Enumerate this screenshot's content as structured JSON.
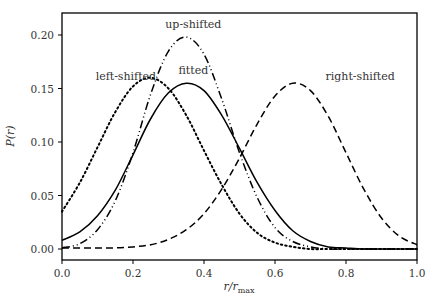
{
  "chart_data": {
    "type": "line",
    "title": "",
    "xlabel": "r/r_max",
    "ylabel": "P(r)",
    "xlim": [
      0.0,
      1.0
    ],
    "ylim": [
      -0.01,
      0.22
    ],
    "grid": false,
    "legend": "none (curves labeled with inline annotations)",
    "x_ticks": [
      "0.0",
      "0.2",
      "0.4",
      "0.6",
      "0.8",
      "1.0"
    ],
    "y_ticks": [
      "0.00",
      "0.05",
      "0.10",
      "0.15",
      "0.20"
    ],
    "x": [
      0.0,
      0.05,
      0.1,
      0.15,
      0.2,
      0.25,
      0.3,
      0.35,
      0.4,
      0.45,
      0.5,
      0.55,
      0.6,
      0.65,
      0.7,
      0.75,
      0.8,
      0.85,
      0.9,
      0.95,
      1.0
    ],
    "series": [
      {
        "name": "fitted",
        "style": "solid",
        "values": [
          0.008,
          0.016,
          0.031,
          0.055,
          0.088,
          0.122,
          0.146,
          0.155,
          0.148,
          0.125,
          0.094,
          0.062,
          0.036,
          0.017,
          0.007,
          0.002,
          0.001,
          0.0,
          0.0,
          0.0,
          0.0
        ]
      },
      {
        "name": "left-shifted",
        "style": "dotted",
        "values": [
          0.035,
          0.062,
          0.095,
          0.128,
          0.152,
          0.16,
          0.15,
          0.125,
          0.092,
          0.06,
          0.033,
          0.015,
          0.006,
          0.002,
          0.0,
          0.0,
          0.0,
          0.0,
          0.0,
          0.0,
          0.0
        ]
      },
      {
        "name": "up-shifted",
        "style": "dash-dot-dot",
        "values": [
          0.001,
          0.005,
          0.018,
          0.045,
          0.09,
          0.145,
          0.185,
          0.198,
          0.182,
          0.14,
          0.09,
          0.048,
          0.02,
          0.007,
          0.002,
          0.0,
          0.0,
          0.0,
          0.0,
          0.0,
          0.0
        ]
      },
      {
        "name": "right-shifted",
        "style": "dashed",
        "values": [
          0.001,
          0.001,
          0.001,
          0.001,
          0.002,
          0.004,
          0.009,
          0.018,
          0.033,
          0.056,
          0.085,
          0.117,
          0.143,
          0.155,
          0.148,
          0.124,
          0.09,
          0.056,
          0.029,
          0.012,
          0.004
        ]
      }
    ],
    "annotations": [
      {
        "text": "left-shifted",
        "x": 0.18,
        "y": 0.158
      },
      {
        "text": "up-shifted",
        "x": 0.37,
        "y": 0.207
      },
      {
        "text": "fitted",
        "x": 0.37,
        "y": 0.164
      },
      {
        "text": "right-shifted",
        "x": 0.84,
        "y": 0.158
      }
    ]
  },
  "labels": {
    "xlabel_main": "r/r",
    "xlabel_sub": "max",
    "ylabel": "P(r)"
  }
}
